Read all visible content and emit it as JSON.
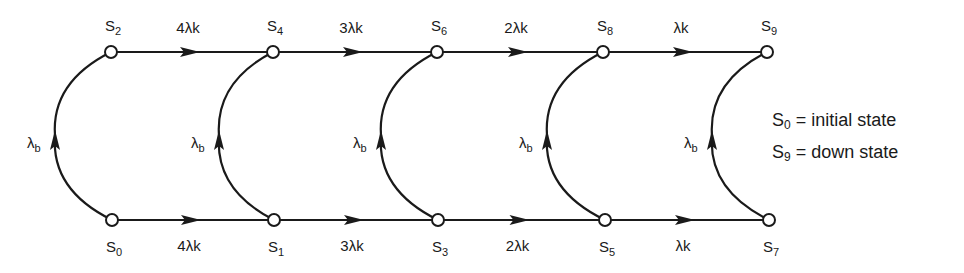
{
  "diagram": {
    "title": "",
    "nodes": [
      {
        "id": "S0",
        "base": "S",
        "sub": "0",
        "x": 112,
        "y": 220,
        "label_pos": "below"
      },
      {
        "id": "S1",
        "base": "S",
        "sub": "1",
        "x": 274,
        "y": 220,
        "label_pos": "below"
      },
      {
        "id": "S2",
        "base": "S",
        "sub": "2",
        "x": 111,
        "y": 52,
        "label_pos": "above"
      },
      {
        "id": "S3",
        "base": "S",
        "sub": "3",
        "x": 438,
        "y": 220,
        "label_pos": "below"
      },
      {
        "id": "S4",
        "base": "S",
        "sub": "4",
        "x": 273,
        "y": 52,
        "label_pos": "above"
      },
      {
        "id": "S5",
        "base": "S",
        "sub": "5",
        "x": 605,
        "y": 220,
        "label_pos": "below"
      },
      {
        "id": "S6",
        "base": "S",
        "sub": "6",
        "x": 437,
        "y": 52,
        "label_pos": "above"
      },
      {
        "id": "S7",
        "base": "S",
        "sub": "7",
        "x": 769,
        "y": 220,
        "label_pos": "below"
      },
      {
        "id": "S8",
        "base": "S",
        "sub": "8",
        "x": 603,
        "y": 52,
        "label_pos": "above"
      },
      {
        "id": "S9",
        "base": "S",
        "sub": "9",
        "x": 767,
        "y": 52,
        "label_pos": "above"
      }
    ],
    "edges": [
      {
        "from": "S2",
        "to": "S4",
        "type": "straight",
        "label": "4λk",
        "label_pos": "above"
      },
      {
        "from": "S4",
        "to": "S6",
        "type": "straight",
        "label": "3λk",
        "label_pos": "above"
      },
      {
        "from": "S6",
        "to": "S8",
        "type": "straight",
        "label": "2λk",
        "label_pos": "above"
      },
      {
        "from": "S8",
        "to": "S9",
        "type": "straight",
        "label": "λk",
        "label_pos": "above"
      },
      {
        "from": "S0",
        "to": "S1",
        "type": "straight",
        "label": "4λk",
        "label_pos": "below"
      },
      {
        "from": "S1",
        "to": "S3",
        "type": "straight",
        "label": "3λk",
        "label_pos": "below"
      },
      {
        "from": "S3",
        "to": "S5",
        "type": "straight",
        "label": "2λk",
        "label_pos": "below"
      },
      {
        "from": "S5",
        "to": "S7",
        "type": "straight",
        "label": "λk",
        "label_pos": "below"
      },
      {
        "from": "S0",
        "to": "S2",
        "type": "arc",
        "label": "λb",
        "label_base": "λ",
        "label_sub": "b",
        "bulge_x": 55
      },
      {
        "from": "S1",
        "to": "S4",
        "type": "arc",
        "label": "λb",
        "label_base": "λ",
        "label_sub": "b",
        "bulge_x": 219
      },
      {
        "from": "S3",
        "to": "S6",
        "type": "arc",
        "label": "λb",
        "label_base": "λ",
        "label_sub": "b",
        "bulge_x": 381
      },
      {
        "from": "S5",
        "to": "S8",
        "type": "arc",
        "label": "λb",
        "label_base": "λ",
        "label_sub": "b",
        "bulge_x": 547
      },
      {
        "from": "S7",
        "to": "S9",
        "type": "arc",
        "label": "λb",
        "label_base": "λ",
        "label_sub": "b",
        "bulge_x": 712
      }
    ]
  },
  "legend": [
    {
      "base": "S",
      "sub": "0",
      "text": "= initial state"
    },
    {
      "base": "S",
      "sub": "9",
      "text": "= down state"
    }
  ],
  "colors": {
    "line": "#1a1a1a",
    "node_fill": "#ffffff",
    "background": "#ffffff"
  }
}
